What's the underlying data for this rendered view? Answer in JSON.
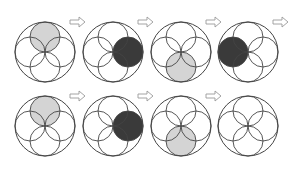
{
  "diagram": {
    "colors": {
      "stroke": "#444444",
      "light_fill": "#d4d4d4",
      "dark_fill": "#3a3a3a",
      "arrow_stroke": "#9a9a9a",
      "background": "#ffffff"
    },
    "rows": [
      {
        "cy": 52,
        "figures": [
          {
            "cx": 45,
            "highlight": "top",
            "fill": "light"
          },
          {
            "cx": 113,
            "highlight": "right",
            "fill": "dark"
          },
          {
            "cx": 181,
            "highlight": "bottom",
            "fill": "light"
          },
          {
            "cx": 248,
            "highlight": "left",
            "fill": "dark"
          }
        ],
        "arrows": [
          {
            "x": 70,
            "y": 22
          },
          {
            "x": 138,
            "y": 22
          },
          {
            "x": 206,
            "y": 22
          },
          {
            "x": 273,
            "y": 22
          }
        ]
      },
      {
        "cy": 126,
        "figures": [
          {
            "cx": 45,
            "highlight": "top",
            "fill": "light"
          },
          {
            "cx": 113,
            "highlight": "right",
            "fill": "dark"
          },
          {
            "cx": 181,
            "highlight": "bottom",
            "fill": "light"
          },
          {
            "cx": 248,
            "highlight": "none",
            "fill": "none"
          }
        ],
        "arrows": [
          {
            "x": 70,
            "y": 96
          },
          {
            "x": 138,
            "y": 96
          },
          {
            "x": 206,
            "y": 96
          }
        ]
      }
    ],
    "outer_radius": 30,
    "petal_radius": 15
  }
}
